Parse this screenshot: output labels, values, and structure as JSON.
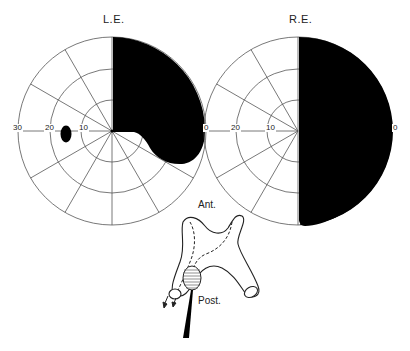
{
  "figure": {
    "fields": [
      {
        "id": "left",
        "title": "L.E.",
        "center": [
          112,
          131
        ],
        "ring_labels": [
          "30",
          "20",
          "10"
        ],
        "defects": [
          "upper temporal quadrant defect extending to lower temporal",
          "small paracentral scotoma at ~15° nasal"
        ]
      },
      {
        "id": "right",
        "title": "R.E.",
        "center": [
          298,
          131
        ],
        "ring_labels": [
          "20",
          "10"
        ],
        "edge_labels": [
          "0",
          "0"
        ],
        "defects": [
          "complete temporal hemianopia"
        ]
      }
    ],
    "schematic": {
      "labels": {
        "anterior": "Ant.",
        "posterior": "Post."
      }
    },
    "colors": {
      "ink": "#111111",
      "grid": "#555555",
      "background": "#ffffff"
    }
  }
}
